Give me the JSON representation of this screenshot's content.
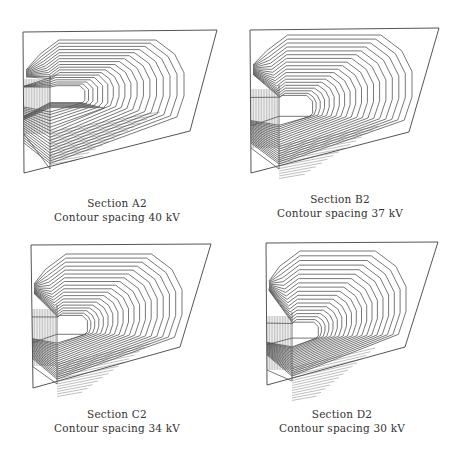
{
  "figure": {
    "line_color": "#555555",
    "background": "#ffffff",
    "panels": [
      {
        "id": "A2",
        "title": "Section A2",
        "caption": "Contour spacing 40 kV",
        "spacing_kv": 40,
        "boundary": [
          [
            23,
            32
          ],
          [
            217,
            30
          ],
          [
            190,
            131
          ],
          [
            24,
            173
          ]
        ],
        "core": {
          "x1": 55,
          "y1": 87,
          "x2": 82,
          "y2": 102
        },
        "outer": {
          "left": 33,
          "top": 40,
          "right": 184,
          "bottom": 124
        },
        "wall_x": 50,
        "rings": 18,
        "label_pos": {
          "x": 7,
          "y": 196
        }
      },
      {
        "id": "B2",
        "title": "Section B2",
        "caption": "Contour spacing 37 kV",
        "spacing_kv": 37,
        "boundary": [
          [
            250,
            30
          ],
          [
            439,
            28
          ],
          [
            409,
            132
          ],
          [
            251,
            173
          ]
        ],
        "core": {
          "x1": 279,
          "y1": 97,
          "x2": 310,
          "y2": 116
        },
        "outer": {
          "left": 259,
          "top": 35,
          "right": 412,
          "bottom": 128
        },
        "wall_x": 279,
        "rings": 19,
        "label_pos": {
          "x": 230,
          "y": 192
        }
      },
      {
        "id": "C2",
        "title": "Section C2",
        "caption": "Contour spacing 34 kV",
        "spacing_kv": 34,
        "boundary": [
          [
            31,
            245
          ],
          [
            211,
            244
          ],
          [
            180,
            347
          ],
          [
            33,
            388
          ]
        ],
        "core": {
          "x1": 57,
          "y1": 317,
          "x2": 85,
          "y2": 334
        },
        "outer": {
          "left": 38,
          "top": 254,
          "right": 182,
          "bottom": 345
        },
        "wall_x": 57,
        "rings": 19,
        "label_pos": {
          "x": 7,
          "y": 407
        }
      },
      {
        "id": "D2",
        "title": "Section D2",
        "caption": "Contour spacing 30 kV",
        "spacing_kv": 30,
        "boundary": [
          [
            266,
            243
          ],
          [
            438,
            242
          ],
          [
            405,
            347
          ],
          [
            267,
            385
          ]
        ],
        "core": {
          "x1": 292,
          "y1": 324,
          "x2": 316,
          "y2": 338
        },
        "outer": {
          "left": 272,
          "top": 251,
          "right": 406,
          "bottom": 342
        },
        "wall_x": 292,
        "rings": 19,
        "label_pos": {
          "x": 232,
          "y": 407
        }
      }
    ]
  }
}
